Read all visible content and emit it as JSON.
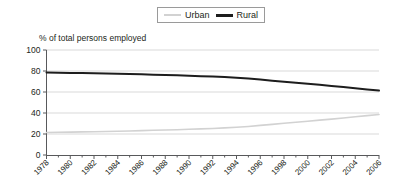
{
  "chart_data": {
    "type": "line",
    "title": "",
    "subtitle": "",
    "ylabel": "% of total persons employed",
    "xlabel": "",
    "ylim": [
      0,
      100
    ],
    "yticks": [
      0,
      20,
      40,
      60,
      80,
      100
    ],
    "ytick_labels": [
      "0",
      "20",
      "40",
      "60",
      "80",
      "100"
    ],
    "grid": true,
    "grid_axis": "y",
    "legend_position": "top-center",
    "x": [
      1978,
      1979,
      1980,
      1981,
      1982,
      1983,
      1984,
      1985,
      1986,
      1987,
      1988,
      1989,
      1990,
      1991,
      1992,
      1993,
      1994,
      1995,
      1996,
      1997,
      1998,
      1999,
      2000,
      2001,
      2002,
      2003,
      2004,
      2005,
      2006
    ],
    "xtick_labels": [
      "1978",
      "1980",
      "1982",
      "1984",
      "1986",
      "1988",
      "1990",
      "1992",
      "1994",
      "1996",
      "1998",
      "2000",
      "2002",
      "2004",
      "2006"
    ],
    "xtick_values": [
      1978,
      1980,
      1982,
      1984,
      1986,
      1988,
      1990,
      1992,
      1994,
      1996,
      1998,
      2000,
      2002,
      2004,
      2006
    ],
    "xlim": [
      1978,
      2006
    ],
    "series": [
      {
        "name": "Urban",
        "color": "#d2d2d2",
        "width": 1.6,
        "values": [
          21.4,
          21.6,
          21.8,
          22.0,
          22.2,
          22.4,
          22.6,
          22.9,
          23.2,
          23.5,
          23.8,
          24.1,
          24.5,
          24.9,
          25.3,
          25.8,
          26.4,
          27.2,
          28.2,
          29.2,
          30.2,
          31.2,
          32.2,
          33.2,
          34.2,
          35.3,
          36.4,
          37.5,
          38.6
        ]
      },
      {
        "name": "Rural",
        "color": "#1d1d1d",
        "width": 2.0,
        "values": [
          78.6,
          78.4,
          78.2,
          78.0,
          77.8,
          77.6,
          77.4,
          77.1,
          76.8,
          76.5,
          76.2,
          75.9,
          75.5,
          75.1,
          74.7,
          74.2,
          73.6,
          72.8,
          71.8,
          70.8,
          69.8,
          68.8,
          67.8,
          66.8,
          65.8,
          64.7,
          63.6,
          62.5,
          61.4
        ]
      }
    ]
  },
  "legend": {
    "items": [
      {
        "label": "Urban",
        "key": "urban"
      },
      {
        "label": "Rural",
        "key": "rural"
      }
    ]
  }
}
